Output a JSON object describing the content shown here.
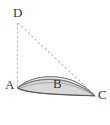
{
  "figure": {
    "kind": "geometry-diagram",
    "background_color": "#ffffff",
    "labels": {
      "D": "D",
      "A": "A",
      "B": "B",
      "C": "C"
    },
    "label_color": "#3a3a3a",
    "stroke_color": "#5a5a5a",
    "dash_color": "#b4b4b4",
    "fill_color": "#d6d6d6",
    "fill_color_light": "#ececec",
    "points": {
      "A": {
        "x": 17,
        "y": 88
      },
      "B": {
        "x": 58,
        "y": 87
      },
      "C": {
        "x": 95,
        "y": 96
      },
      "D": {
        "x": 17,
        "y": 22
      }
    },
    "elements": [
      {
        "name": "dashed-vertical-DA",
        "type": "dashed-line",
        "from": "D",
        "to": "A"
      },
      {
        "name": "dashed-diagonal-DC",
        "type": "dashed-line",
        "from": "D",
        "to": "C"
      },
      {
        "name": "crescent-region-ABC",
        "type": "filled-curved-region",
        "from": "A",
        "to": "C"
      },
      {
        "name": "inner-arc",
        "type": "curve",
        "from": "A",
        "to": "C"
      },
      {
        "name": "lower-arc",
        "type": "curve",
        "from": "A",
        "to": "C"
      }
    ]
  }
}
